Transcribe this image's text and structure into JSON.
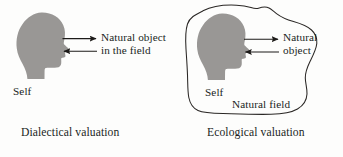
{
  "figure": {
    "background_color": "#fdfdfc",
    "ink_color": "#211f1d",
    "silhouette_color": "#999795"
  },
  "panels": [
    {
      "id": "dialectical",
      "caption": "Dialectical valuation",
      "self_label": "Self",
      "object_label_line1": "Natural object",
      "object_label_line2": "in the field",
      "has_enclosing_field": false,
      "arrows": [
        {
          "direction": "right",
          "from": "self",
          "to": "natural-object"
        },
        {
          "direction": "left",
          "from": "natural-object",
          "to": "self"
        }
      ]
    },
    {
      "id": "ecological",
      "caption": "Ecological valuation",
      "self_label": "Self",
      "object_label_line1": "Natural",
      "object_label_line2": "object",
      "field_label": "Natural field",
      "has_enclosing_field": true,
      "arrows": [
        {
          "direction": "right",
          "from": "self",
          "to": "natural-object"
        },
        {
          "direction": "left",
          "from": "natural-object",
          "to": "self"
        }
      ]
    }
  ],
  "icons": {
    "head": "head-silhouette-icon",
    "arrow_right": "arrow-right-icon",
    "arrow_left": "arrow-left-icon",
    "blob": "natural-field-boundary-icon"
  }
}
